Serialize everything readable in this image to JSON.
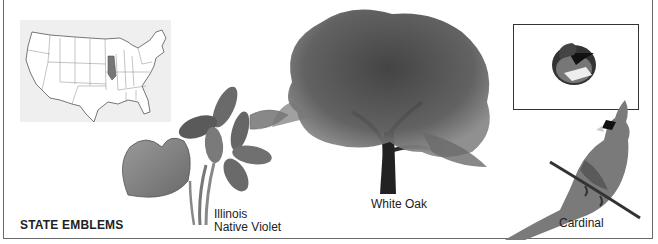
{
  "title": "STATE EMBLEMS",
  "emblems": [
    {
      "name": "map",
      "label": "Map of United States with Illinois highlighted"
    },
    {
      "name": "flower",
      "label_line1": "Illinois",
      "label_line2": "Native Violet"
    },
    {
      "name": "tree",
      "label": "White Oak"
    },
    {
      "name": "bird",
      "label": "Cardinal"
    },
    {
      "name": "flag",
      "label": "State flag"
    }
  ],
  "colors": {
    "border": "#6a6a6a",
    "map_bg": "#efefef",
    "illinois": "#777777",
    "ink": "#222222"
  }
}
